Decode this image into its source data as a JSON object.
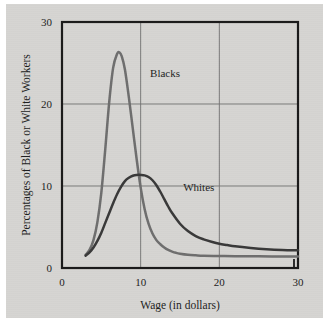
{
  "figure": {
    "background_color": "#d6d5d2",
    "frame_color": "#1a1a1a"
  },
  "chart_data": {
    "type": "line",
    "title": "",
    "xlabel": "Wage (in dollars)",
    "ylabel": "Percentages of Black or White Workers",
    "xlim": [
      0,
      30
    ],
    "ylim": [
      0,
      30
    ],
    "xticks": [
      "0",
      "10",
      "20",
      "30"
    ],
    "xtick_values": [
      0,
      10,
      20,
      30
    ],
    "yticks": [
      "0",
      "10",
      "20",
      "30"
    ],
    "ytick_values": [
      0,
      10,
      20,
      30
    ],
    "grid": true,
    "grid_color": "#6f6f6f",
    "legend_position": "inline-annotations",
    "series": [
      {
        "name": "Blacks",
        "color": "#6e6e6e",
        "label_x": 11.2,
        "label_y": 23.3,
        "x": [
          3.0,
          3.5,
          4.0,
          4.5,
          5.0,
          5.5,
          6.0,
          6.5,
          7.0,
          7.3,
          7.6,
          8.0,
          8.5,
          9.0,
          9.5,
          10.0,
          10.5,
          11.0,
          11.5,
          12.0,
          12.5,
          13.0,
          13.5,
          14.0,
          14.5,
          15.0,
          16.0,
          17.0,
          18.0,
          20.0,
          22.0,
          25.0,
          27.5,
          30.0
        ],
        "y": [
          1.6,
          2.2,
          3.4,
          5.6,
          9.2,
          14.5,
          20.2,
          24.4,
          26.1,
          26.3,
          25.8,
          24.2,
          20.8,
          17.0,
          13.2,
          9.8,
          7.2,
          5.4,
          4.2,
          3.4,
          2.9,
          2.5,
          2.2,
          2.0,
          1.85,
          1.75,
          1.62,
          1.55,
          1.5,
          1.46,
          1.44,
          1.42,
          1.41,
          1.4
        ]
      },
      {
        "name": "Whites",
        "color": "#393939",
        "label_x": 15.4,
        "label_y": 9.4,
        "x": [
          3.0,
          3.5,
          4.0,
          4.5,
          5.0,
          5.5,
          6.0,
          6.5,
          7.0,
          7.5,
          8.0,
          8.5,
          9.0,
          9.5,
          10.0,
          10.5,
          11.0,
          11.5,
          12.0,
          12.5,
          13.0,
          13.5,
          14.0,
          15.0,
          16.0,
          17.0,
          18.0,
          19.0,
          20.0,
          21.0,
          22.0,
          24.0,
          26.0,
          28.0,
          30.0
        ],
        "y": [
          1.5,
          1.9,
          2.5,
          3.3,
          4.3,
          5.5,
          6.7,
          7.9,
          9.0,
          9.9,
          10.6,
          11.0,
          11.25,
          11.35,
          11.35,
          11.3,
          11.1,
          10.7,
          10.1,
          9.3,
          8.4,
          7.5,
          6.7,
          5.4,
          4.5,
          3.9,
          3.5,
          3.2,
          2.95,
          2.8,
          2.65,
          2.45,
          2.3,
          2.2,
          2.15
        ]
      }
    ]
  }
}
